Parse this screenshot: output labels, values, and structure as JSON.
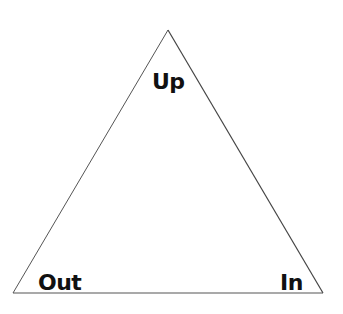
{
  "diagram": {
    "type": "triangle",
    "stroke_color": "#444444",
    "background": "#ffffff",
    "vertices": {
      "top": [
        168,
        30
      ],
      "bottom_left": [
        13,
        293
      ],
      "bottom_right": [
        323,
        293
      ]
    },
    "labels": {
      "top": "Up",
      "bottom_left": "Out",
      "bottom_right": "In"
    }
  }
}
